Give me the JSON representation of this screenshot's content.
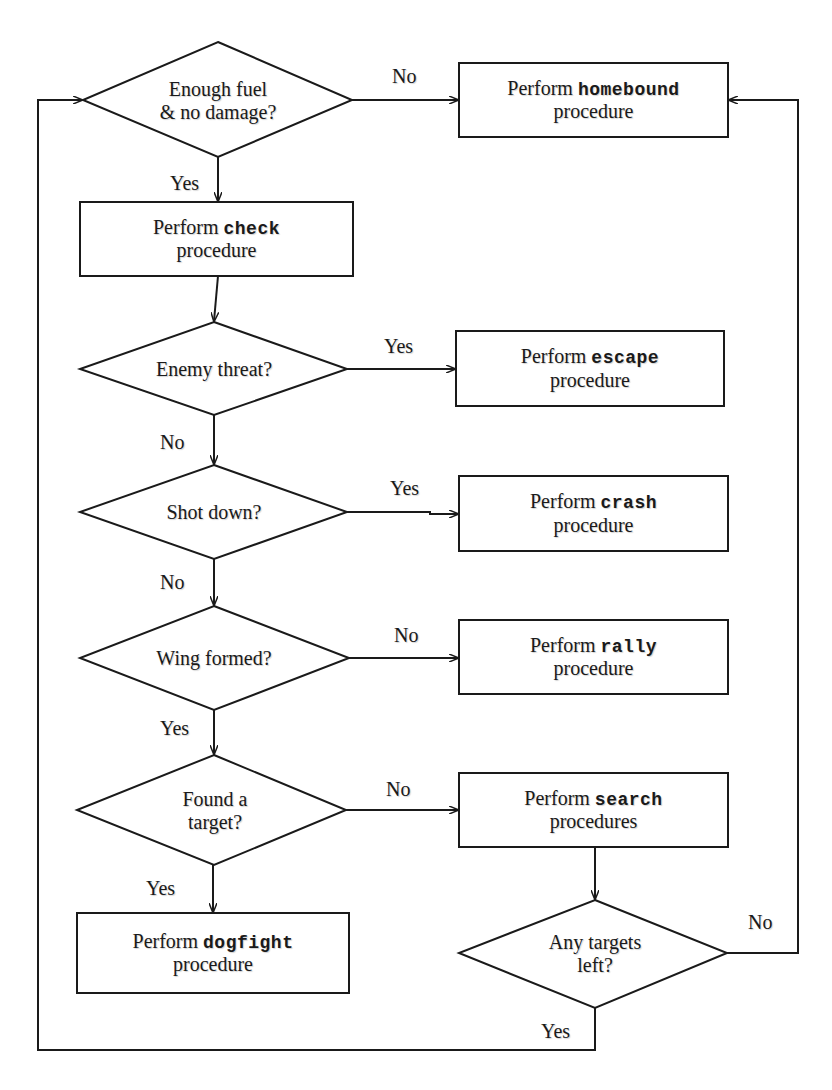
{
  "diagram": {
    "type": "flowchart",
    "colors": {
      "stroke": "#1a1a1a",
      "background": "#ffffff",
      "text": "#1a1a1a"
    },
    "nodes": {
      "d_fuel": {
        "shape": "diamond",
        "line1": "Enough fuel",
        "line2": "& no damage?"
      },
      "p_check": {
        "shape": "process",
        "prefix": "Perform",
        "keyword": "check",
        "suffix": "procedure"
      },
      "d_enemy": {
        "shape": "diamond",
        "line1": "Enemy threat?"
      },
      "d_shot": {
        "shape": "diamond",
        "line1": "Shot down?"
      },
      "d_wing": {
        "shape": "diamond",
        "line1": "Wing formed?"
      },
      "d_found": {
        "shape": "diamond",
        "line1": "Found a",
        "line2": "target?"
      },
      "p_dogfight": {
        "shape": "process",
        "prefix": "Perform",
        "keyword": "dogfight",
        "suffix": "procedure"
      },
      "p_homebound": {
        "shape": "process",
        "prefix": "Perform",
        "keyword": "homebound",
        "suffix": "procedure"
      },
      "p_escape": {
        "shape": "process",
        "prefix": "Perform",
        "keyword": "escape",
        "suffix": "procedure"
      },
      "p_crash": {
        "shape": "process",
        "prefix": "Perform",
        "keyword": "crash",
        "suffix": "procedure"
      },
      "p_rally": {
        "shape": "process",
        "prefix": "Perform",
        "keyword": "rally",
        "suffix": "procedure"
      },
      "p_search": {
        "shape": "process",
        "prefix": "Perform",
        "keyword": "search",
        "suffix": "procedures"
      },
      "d_any": {
        "shape": "diamond",
        "line1": "Any targets",
        "line2": "left?"
      }
    },
    "edges": [
      {
        "from": "d_fuel",
        "to": "p_homebound",
        "label": "No"
      },
      {
        "from": "d_fuel",
        "to": "p_check",
        "label": "Yes"
      },
      {
        "from": "p_check",
        "to": "d_enemy",
        "label": ""
      },
      {
        "from": "d_enemy",
        "to": "p_escape",
        "label": "Yes"
      },
      {
        "from": "d_enemy",
        "to": "d_shot",
        "label": "No"
      },
      {
        "from": "d_shot",
        "to": "p_crash",
        "label": "Yes"
      },
      {
        "from": "d_shot",
        "to": "d_wing",
        "label": "No"
      },
      {
        "from": "d_wing",
        "to": "p_rally",
        "label": "No"
      },
      {
        "from": "d_wing",
        "to": "d_found",
        "label": "Yes"
      },
      {
        "from": "d_found",
        "to": "p_search",
        "label": "No"
      },
      {
        "from": "d_found",
        "to": "p_dogfight",
        "label": "Yes"
      },
      {
        "from": "p_search",
        "to": "d_any",
        "label": ""
      },
      {
        "from": "d_any",
        "to": "p_homebound",
        "label": "No"
      },
      {
        "from": "d_any",
        "to": "d_fuel",
        "label": "Yes"
      }
    ],
    "labels": {
      "fuel_no": "No",
      "fuel_yes": "Yes",
      "enemy_yes": "Yes",
      "enemy_no": "No",
      "shot_yes": "Yes",
      "shot_no": "No",
      "wing_no": "No",
      "wing_yes": "Yes",
      "found_no": "No",
      "found_yes": "Yes",
      "any_no": "No",
      "any_yes": "Yes"
    }
  }
}
